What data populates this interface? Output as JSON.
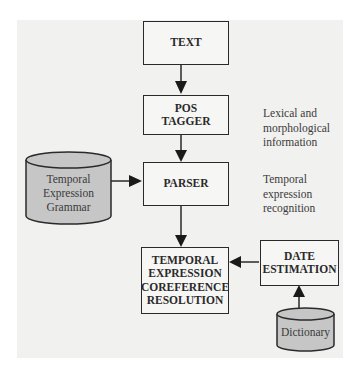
{
  "diagram": {
    "type": "flowchart",
    "nodes": {
      "text": {
        "label": "TEXT"
      },
      "pos_tagger": {
        "line1": "POS",
        "line2": "TAGGER"
      },
      "parser": {
        "label": "PARSER"
      },
      "coreference": {
        "line1": "TEMPORAL",
        "line2": "EXPRESSION",
        "line3": "COREFERENCE",
        "line4": "RESOLUTION"
      },
      "date_estimation": {
        "line1": "DATE",
        "line2": "ESTIMATION"
      },
      "grammar_db": {
        "line1": "Temporal",
        "line2": "Expression",
        "line3": "Grammar"
      },
      "dictionary_db": {
        "label": "Dictionary"
      }
    },
    "annotations": {
      "pos_tagger_note": {
        "line1": "Lexical and",
        "line2": "morphological",
        "line3": "information"
      },
      "parser_note": {
        "line1": "Temporal",
        "line2": "expression",
        "line3": "recognition"
      }
    },
    "edges": [
      {
        "from": "TEXT",
        "to": "POS TAGGER"
      },
      {
        "from": "POS TAGGER",
        "to": "PARSER"
      },
      {
        "from": "Temporal Expression Grammar",
        "to": "PARSER"
      },
      {
        "from": "PARSER",
        "to": "TEMPORAL EXPRESSION COREFERENCE RESOLUTION"
      },
      {
        "from": "DATE ESTIMATION",
        "to": "TEMPORAL EXPRESSION COREFERENCE RESOLUTION"
      },
      {
        "from": "Dictionary",
        "to": "DATE ESTIMATION"
      }
    ],
    "colors": {
      "background": "#f1f1f0",
      "box_fill": "#f6f6f5",
      "stroke": "#2a2a2a",
      "cylinder_fill": "#c6c6c6"
    }
  }
}
